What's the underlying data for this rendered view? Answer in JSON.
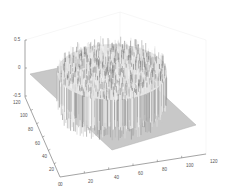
{
  "chart_data": {
    "type": "surface",
    "title": "",
    "xlabel": "",
    "ylabel": "",
    "zlabel": "",
    "xlim": [
      0,
      120
    ],
    "ylim": [
      0,
      120
    ],
    "zlim": [
      -0.5,
      0.5
    ],
    "x_ticks": [
      "0",
      "20",
      "40",
      "60",
      "80",
      "100",
      "120"
    ],
    "y_ticks": [
      "0",
      "20",
      "40",
      "60",
      "80",
      "100",
      "120"
    ],
    "z_ticks": [
      "-0.5",
      "0",
      "0.5"
    ],
    "grid": false,
    "colormap": "gray",
    "spike_region": {
      "shape": "circle",
      "center": [
        60,
        60
      ],
      "radius": 40,
      "z_range": [
        -0.5,
        0.5
      ]
    },
    "base_plane_z": 0
  },
  "axes": {
    "z": {
      "ticks": [
        {
          "label": "0.5",
          "x": 14,
          "y": 41
        },
        {
          "label": "0",
          "x": 18,
          "y": 69
        },
        {
          "label": "-0.5",
          "x": 13,
          "y": 97
        }
      ]
    },
    "y": {
      "ticks": [
        {
          "label": "120",
          "x": 13,
          "y": 104
        },
        {
          "label": "100",
          "x": 20,
          "y": 117
        },
        {
          "label": "80",
          "x": 28,
          "y": 131
        },
        {
          "label": "60",
          "x": 35,
          "y": 145
        },
        {
          "label": "40",
          "x": 42,
          "y": 158
        },
        {
          "label": "20",
          "x": 49,
          "y": 171
        },
        {
          "label": "0",
          "x": 58,
          "y": 186
        }
      ]
    },
    "x": {
      "ticks": [
        {
          "label": "0",
          "x": 60,
          "y": 186
        },
        {
          "label": "20",
          "x": 88,
          "y": 183
        },
        {
          "label": "40",
          "x": 114,
          "y": 179
        },
        {
          "label": "60",
          "x": 138,
          "y": 175
        },
        {
          "label": "80",
          "x": 162,
          "y": 171
        },
        {
          "label": "100",
          "x": 186,
          "y": 167
        },
        {
          "label": "120",
          "x": 210,
          "y": 163
        }
      ]
    }
  }
}
